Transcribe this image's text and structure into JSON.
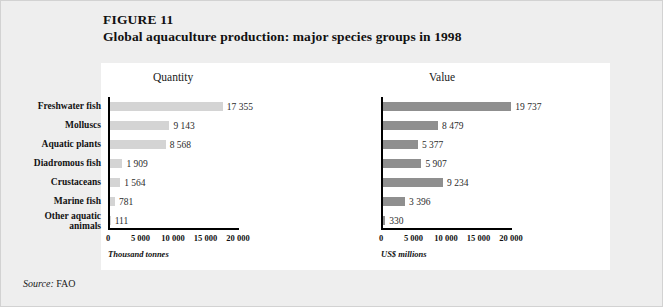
{
  "figure": {
    "number": "FIGURE 11",
    "title": "Global aquaculture production: major species groups in 1998",
    "source_label": "Source:",
    "source_value": "FAO",
    "background_color": "#eeeeee",
    "panel_color": "#ffffff"
  },
  "chart_data": [
    {
      "type": "bar",
      "orientation": "horizontal",
      "title": "Quantity",
      "xlabel": "Thousand tonnes",
      "ylabel": "",
      "xlim": [
        0,
        20000
      ],
      "xticks": [
        0,
        5000,
        10000,
        15000,
        20000
      ],
      "xtick_labels": [
        "0",
        "5 000",
        "10 000",
        "15 000",
        "20 000"
      ],
      "grid": false,
      "legend": false,
      "bar_color": "#d4d4d4",
      "categories": [
        "Freshwater fish",
        "Molluscs",
        "Aquatic plants",
        "Diadromous fish",
        "Crustaceans",
        "Marine fish",
        "Other aquatic animals"
      ],
      "values": [
        17355,
        9143,
        8568,
        1909,
        1564,
        781,
        111
      ],
      "value_labels": [
        "17 355",
        "9 143",
        "8 568",
        "1 909",
        "1 564",
        "781",
        "111"
      ]
    },
    {
      "type": "bar",
      "orientation": "horizontal",
      "title": "Value",
      "xlabel": "US$ millions",
      "ylabel": "",
      "xlim": [
        0,
        20000
      ],
      "xticks": [
        0,
        5000,
        10000,
        15000,
        20000
      ],
      "xtick_labels": [
        "0",
        "5 000",
        "10 000",
        "15 000",
        "20 000"
      ],
      "grid": false,
      "legend": false,
      "bar_color": "#8f8f8f",
      "categories": [
        "Freshwater fish",
        "Molluscs",
        "Aquatic plants",
        "Diadromous fish",
        "Crustaceans",
        "Marine fish",
        "Other aquatic animals"
      ],
      "values": [
        19737,
        8479,
        5377,
        5907,
        9234,
        3396,
        330
      ],
      "value_labels": [
        "19 737",
        "8 479",
        "5 377",
        "5 907",
        "9 234",
        "3 396",
        "330"
      ]
    }
  ],
  "category_display": [
    {
      "line1": "Freshwater fish",
      "line2": ""
    },
    {
      "line1": "Molluscs",
      "line2": ""
    },
    {
      "line1": "Aquatic plants",
      "line2": ""
    },
    {
      "line1": "Diadromous fish",
      "line2": ""
    },
    {
      "line1": "Crustaceans",
      "line2": ""
    },
    {
      "line1": "Marine fish",
      "line2": ""
    },
    {
      "line1": "Other aquatic",
      "line2": "animals"
    }
  ]
}
